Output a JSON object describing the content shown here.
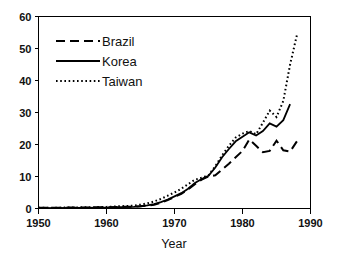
{
  "chart_data": {
    "type": "line",
    "title": "",
    "subtitle": "",
    "xlabel": "Year",
    "ylabel": "",
    "xlim": [
      1950,
      1990
    ],
    "ylim": [
      0,
      60
    ],
    "xticks": [
      1950,
      1960,
      1970,
      1980,
      1990
    ],
    "yticks": [
      0,
      10,
      20,
      30,
      40,
      50,
      60
    ],
    "xtick_labels": [
      "1950",
      "1960",
      "1970",
      "1980",
      "1990"
    ],
    "ytick_labels": [
      "0",
      "10",
      "20",
      "30",
      "40",
      "50",
      "60"
    ],
    "grid": false,
    "legend_position": "upper-left",
    "series": [
      {
        "name": "Brazil",
        "style": "dashed",
        "color": "#000000",
        "x": [
          1950,
          1955,
          1960,
          1962,
          1964,
          1965,
          1966,
          1967,
          1968,
          1969,
          1970,
          1971,
          1972,
          1973,
          1974,
          1975,
          1976,
          1977,
          1978,
          1979,
          1980,
          1981,
          1982,
          1983,
          1984,
          1985,
          1986,
          1987,
          1988
        ],
        "values": [
          0.2,
          0.3,
          0.4,
          0.5,
          0.6,
          0.7,
          0.9,
          1.2,
          1.8,
          2.6,
          3.6,
          4.6,
          6.0,
          7.6,
          9.0,
          10.0,
          10.4,
          12.2,
          14.0,
          16.0,
          18.0,
          21.6,
          19.6,
          17.6,
          18.0,
          21.2,
          18.2,
          17.8,
          21.0
        ]
      },
      {
        "name": "Korea",
        "style": "solid",
        "color": "#000000",
        "x": [
          1950,
          1955,
          1960,
          1962,
          1964,
          1965,
          1966,
          1967,
          1968,
          1969,
          1970,
          1971,
          1972,
          1973,
          1974,
          1975,
          1976,
          1977,
          1978,
          1979,
          1980,
          1981,
          1982,
          1983,
          1984,
          1985,
          1986,
          1987
        ],
        "values": [
          0.1,
          0.2,
          0.3,
          0.4,
          0.5,
          0.7,
          1.0,
          1.4,
          2.0,
          2.8,
          3.8,
          4.8,
          6.2,
          8.0,
          9.2,
          10.2,
          12.8,
          16.0,
          18.6,
          21.0,
          22.4,
          23.8,
          22.8,
          24.2,
          26.6,
          25.6,
          27.6,
          32.6
        ]
      },
      {
        "name": "Taiwan",
        "style": "dotted",
        "color": "#000000",
        "x": [
          1950,
          1955,
          1960,
          1962,
          1964,
          1965,
          1966,
          1967,
          1968,
          1969,
          1970,
          1971,
          1972,
          1973,
          1974,
          1975,
          1976,
          1977,
          1978,
          1979,
          1980,
          1981,
          1982,
          1983,
          1984,
          1985,
          1986,
          1987,
          1988
        ],
        "values": [
          0.2,
          0.3,
          0.5,
          0.7,
          0.9,
          1.2,
          1.6,
          2.2,
          3.0,
          4.0,
          5.0,
          6.2,
          7.6,
          9.0,
          9.6,
          10.4,
          13.2,
          16.6,
          19.6,
          22.2,
          23.4,
          24.2,
          23.2,
          26.8,
          30.6,
          28.6,
          33.6,
          45.0,
          54.2
        ]
      }
    ]
  },
  "legend": {
    "items": [
      {
        "label": "Brazil",
        "style": "dashed"
      },
      {
        "label": "Korea",
        "style": "solid"
      },
      {
        "label": "Taiwan",
        "style": "dotted"
      }
    ]
  },
  "axes": {
    "x_title": "Year"
  },
  "colors": {
    "ink": "#000000",
    "background": "#ffffff"
  }
}
